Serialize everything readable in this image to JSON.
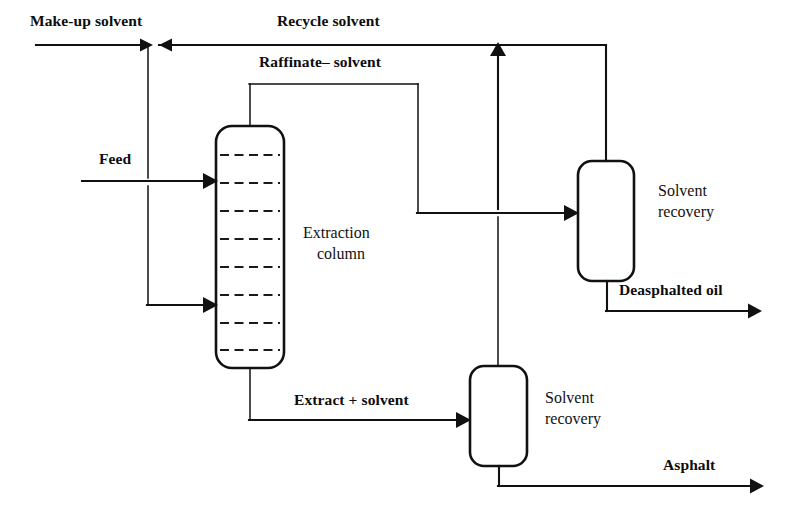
{
  "diagram": {
    "canvas": {
      "width": 796,
      "height": 525
    },
    "colors": {
      "line": "#111111",
      "background": "#ffffff",
      "text": "#0d0d0d"
    }
  },
  "equipment": [
    {
      "id": "extraction-column",
      "label_line1": "Extraction",
      "label_line2": "column",
      "shape": "rounded-rectangle",
      "trays": 8
    },
    {
      "id": "solvent-recovery-upper",
      "label_line1": "Solvent",
      "label_line2": "recovery",
      "shape": "rounded-rectangle"
    },
    {
      "id": "solvent-recovery-lower",
      "label_line1": "Solvent",
      "label_line2": "recovery",
      "shape": "rounded-rectangle"
    }
  ],
  "streams": [
    {
      "id": "make-up-solvent",
      "label": "Make-up solvent"
    },
    {
      "id": "recycle-solvent",
      "label": "Recycle solvent"
    },
    {
      "id": "raffinate-solvent",
      "label": "Raffinate– solvent"
    },
    {
      "id": "feed",
      "label": "Feed"
    },
    {
      "id": "extract-solvent",
      "label": "Extract + solvent"
    },
    {
      "id": "deasphalted-oil",
      "label": "Deasphalted oil"
    },
    {
      "id": "asphalt",
      "label": "Asphalt"
    }
  ],
  "labels": {
    "make_up_solvent": "Make-up solvent",
    "recycle_solvent": "Recycle solvent",
    "raffinate_solvent": "Raffinate– solvent",
    "feed": "Feed",
    "extract_solvent": "Extract + solvent",
    "deasphalted_oil": "Deasphalted oil",
    "asphalt": "Asphalt",
    "extraction_line1": "Extraction",
    "extraction_line2": "column",
    "solvent_recovery_upper_line1": "Solvent",
    "solvent_recovery_upper_line2": "recovery",
    "solvent_recovery_lower_line1": "Solvent",
    "solvent_recovery_lower_line2": "recovery"
  }
}
